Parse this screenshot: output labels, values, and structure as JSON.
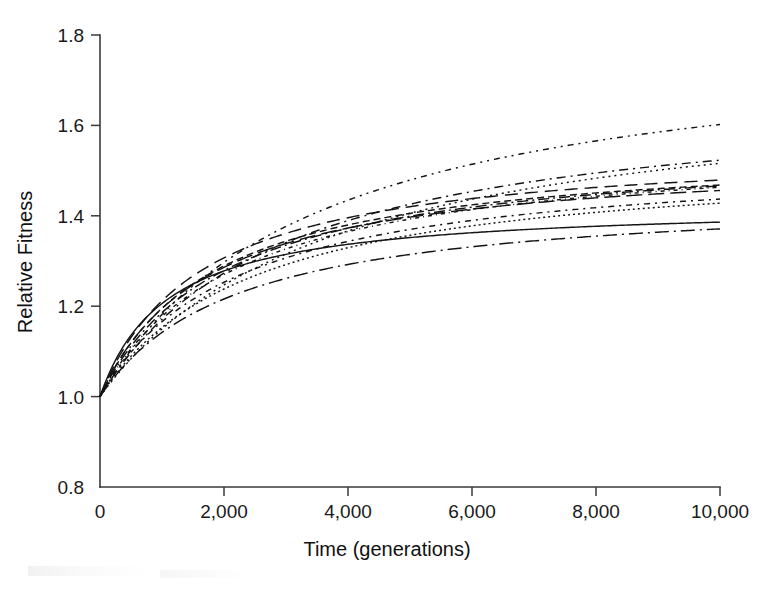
{
  "chart_data": {
    "type": "line",
    "title": "",
    "xlabel": "Time (generations)",
    "ylabel": "Relative Fitness",
    "xlim": [
      0,
      10000
    ],
    "ylim": [
      0.8,
      1.8
    ],
    "xticks": [
      0,
      2000,
      4000,
      6000,
      8000,
      10000
    ],
    "xtick_labels": [
      "0",
      "2,000",
      "4,000",
      "6,000",
      "8,000",
      "10,000"
    ],
    "yticks": [
      0.8,
      1.0,
      1.2,
      1.4,
      1.6,
      1.8
    ],
    "ytick_labels": [
      "0.8",
      "1.0",
      "1.2",
      "1.4",
      "1.6",
      "1.8"
    ],
    "grid": false,
    "legend": "none",
    "x": [
      0,
      250,
      500,
      750,
      1000,
      1500,
      2000,
      2500,
      3000,
      3500,
      4000,
      5000,
      6000,
      7000,
      8000,
      9000,
      10000
    ],
    "series": [
      {
        "name": "population-1",
        "dash": "6,5,2,5,2,5",
        "values": [
          1.0,
          1.086,
          1.141,
          1.181,
          1.213,
          1.261,
          1.297,
          1.326,
          1.35,
          1.371,
          1.389,
          1.42,
          1.446,
          1.468,
          1.487,
          1.504,
          1.602
        ],
        "final": 1.602
      },
      {
        "name": "population-2",
        "dash": "9,5,2,5",
        "values": [
          1.0,
          1.079,
          1.129,
          1.166,
          1.195,
          1.24,
          1.273,
          1.3,
          1.322,
          1.341,
          1.358,
          1.386,
          1.409,
          1.429,
          1.447,
          1.462,
          1.523
        ],
        "final": 1.523
      },
      {
        "name": "population-3",
        "dash": "2,4",
        "values": [
          1.0,
          1.067,
          1.112,
          1.146,
          1.173,
          1.215,
          1.247,
          1.272,
          1.294,
          1.313,
          1.329,
          1.357,
          1.38,
          1.4,
          1.418,
          1.434,
          1.516
        ],
        "final": 1.516
      },
      {
        "name": "population-4",
        "dash": "13,7",
        "values": [
          1.0,
          1.106,
          1.163,
          1.202,
          1.232,
          1.276,
          1.307,
          1.331,
          1.35,
          1.366,
          1.38,
          1.403,
          1.421,
          1.437,
          1.45,
          1.461,
          1.479
        ],
        "final": 1.479
      },
      {
        "name": "population-5",
        "dash": "7,4",
        "values": [
          1.0,
          1.092,
          1.145,
          1.183,
          1.213,
          1.257,
          1.289,
          1.314,
          1.334,
          1.351,
          1.366,
          1.39,
          1.409,
          1.425,
          1.438,
          1.45,
          1.468
        ],
        "final": 1.468
      },
      {
        "name": "population-6",
        "dash": "11,4,2,4",
        "values": [
          1.0,
          1.083,
          1.134,
          1.172,
          1.202,
          1.246,
          1.279,
          1.305,
          1.326,
          1.344,
          1.36,
          1.385,
          1.405,
          1.421,
          1.435,
          1.447,
          1.466
        ],
        "final": 1.466
      },
      {
        "name": "population-7",
        "dash": "4,4,1,4",
        "values": [
          1.0,
          1.075,
          1.124,
          1.161,
          1.191,
          1.236,
          1.27,
          1.297,
          1.319,
          1.338,
          1.354,
          1.38,
          1.401,
          1.418,
          1.432,
          1.444,
          1.463
        ],
        "final": 1.463
      },
      {
        "name": "population-8",
        "dash": "16,6",
        "values": [
          1.0,
          1.098,
          1.152,
          1.189,
          1.217,
          1.257,
          1.286,
          1.309,
          1.327,
          1.342,
          1.355,
          1.376,
          1.393,
          1.407,
          1.419,
          1.43,
          1.456
        ],
        "final": 1.456
      },
      {
        "name": "population-9",
        "dash": "2,5,6,5",
        "values": [
          1.0,
          1.07,
          1.116,
          1.151,
          1.179,
          1.221,
          1.253,
          1.278,
          1.299,
          1.317,
          1.332,
          1.357,
          1.377,
          1.393,
          1.406,
          1.418,
          1.437
        ],
        "final": 1.437
      },
      {
        "name": "population-10",
        "dash": "2,3",
        "values": [
          1.0,
          1.062,
          1.105,
          1.138,
          1.165,
          1.206,
          1.238,
          1.263,
          1.284,
          1.302,
          1.318,
          1.344,
          1.364,
          1.381,
          1.395,
          1.408,
          1.428
        ],
        "final": 1.428
      },
      {
        "name": "population-11",
        "dash": "0",
        "values": [
          1.0,
          1.101,
          1.154,
          1.189,
          1.215,
          1.251,
          1.278,
          1.298,
          1.314,
          1.327,
          1.338,
          1.356,
          1.369,
          1.379,
          1.387,
          1.393,
          1.386
        ],
        "final": 1.386
      },
      {
        "name": "population-12",
        "dash": "14,5,2,5",
        "values": [
          1.0,
          1.054,
          1.093,
          1.123,
          1.148,
          1.187,
          1.216,
          1.24,
          1.26,
          1.277,
          1.292,
          1.316,
          1.335,
          1.351,
          1.364,
          1.375,
          1.371
        ],
        "final": 1.371
      }
    ]
  },
  "axes": {
    "x_title": "Time (generations)",
    "y_title": "Relative Fitness"
  }
}
